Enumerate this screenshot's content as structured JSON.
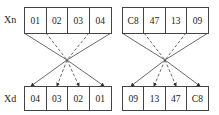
{
  "labels": {
    "top": "Xn",
    "bottom": "Xd"
  },
  "groups": [
    {
      "input": [
        "01",
        "02",
        "03",
        "04"
      ],
      "output": [
        "04",
        "03",
        "02",
        "01"
      ]
    },
    {
      "input": [
        "C8",
        "47",
        "13",
        "09"
      ],
      "output": [
        "09",
        "13",
        "47",
        "C8"
      ]
    }
  ]
}
